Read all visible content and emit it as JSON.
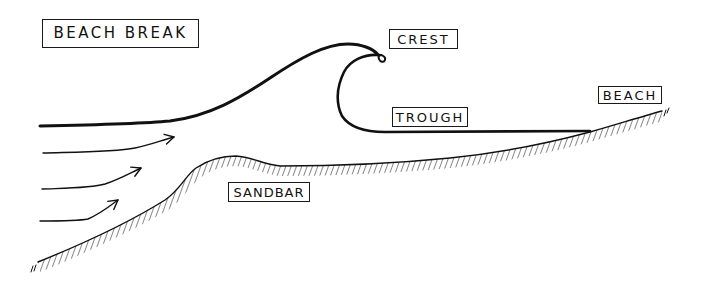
{
  "diagram": {
    "title": "BEACH BREAK",
    "labels": {
      "crest": "CREST",
      "trough": "TROUGH",
      "beach": "BEACH",
      "sandbar": "SANDBAR"
    },
    "elements": {
      "wave_surface": "wave-line",
      "swell_arrows": 3,
      "seabed": "hatched-seabed-line"
    },
    "colors": {
      "ink": "#111111",
      "background": "#ffffff"
    }
  }
}
